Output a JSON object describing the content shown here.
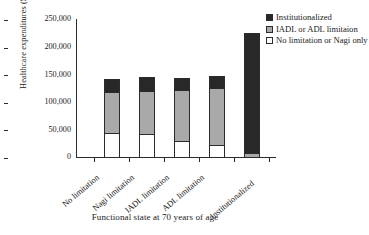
{
  "chart_data": {
    "type": "bar",
    "stacked": true,
    "title": "",
    "xlabel": "Functional state at 70 years of age",
    "ylabel": "Healthcare expenditures ($)",
    "ylim": [
      0,
      250000
    ],
    "yticks": [
      0,
      50000,
      100000,
      150000,
      200000,
      250000
    ],
    "ytick_labels": [
      "0",
      "50,000",
      "100,000",
      "150,000",
      "200,000",
      "250,000"
    ],
    "grid": false,
    "legend_position": "top-right",
    "categories": [
      "No limitation",
      "Nagi limitation",
      "IADL limitation",
      "ADL limitation",
      "Institutionalized"
    ],
    "series": [
      {
        "name": "No limitation or Nagi only",
        "color": "#ffffff",
        "values": [
          43000,
          42000,
          29000,
          22000,
          0
        ]
      },
      {
        "name": "IADL or ADL limitaion",
        "color": "#a9a9a9",
        "values": [
          74000,
          78000,
          92000,
          103000,
          8000
        ]
      },
      {
        "name": "Institutionalized",
        "color": "#282828",
        "values": [
          25000,
          25000,
          22000,
          22000,
          216000
        ]
      }
    ],
    "totals": [
      142000,
      145000,
      143000,
      147000,
      224000
    ]
  },
  "legend": {
    "items": [
      {
        "label": "Institutionalized",
        "swatch": "dark-swatch-icon"
      },
      {
        "label": "IADL or ADL limitaion",
        "swatch": "gray-swatch-icon"
      },
      {
        "label": "No limitation or Nagi only",
        "swatch": "white-swatch-icon"
      }
    ]
  }
}
